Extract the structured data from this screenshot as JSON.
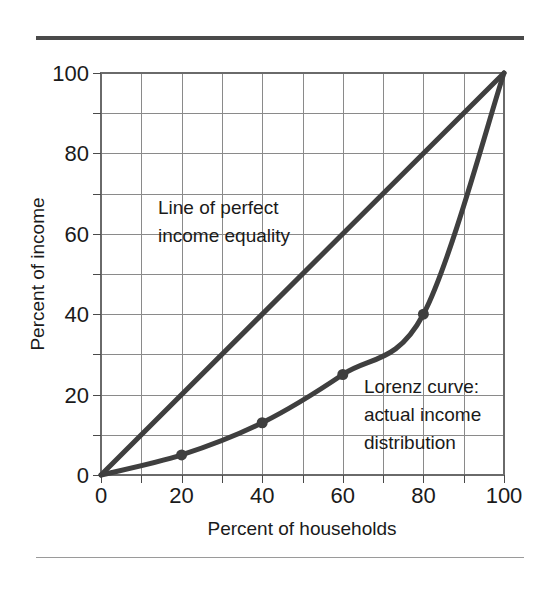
{
  "figure": {
    "rule_top_color": "#4a4a4a",
    "rule_bottom_color": "#9a9a9a",
    "background": "#ffffff"
  },
  "chart_data": {
    "type": "line",
    "title": "",
    "xlabel": "Percent of households",
    "ylabel": "Percent of income",
    "xlim": [
      0,
      100
    ],
    "ylim": [
      0,
      100
    ],
    "xticks": [
      "0",
      "20",
      "40",
      "60",
      "80",
      "100"
    ],
    "yticks": [
      "0",
      "20",
      "40",
      "60",
      "80",
      "100"
    ],
    "xtick_values": [
      0,
      20,
      40,
      60,
      80,
      100
    ],
    "ytick_values": [
      0,
      20,
      40,
      60,
      80,
      100
    ],
    "grid": true,
    "grid_step": 10,
    "grid_color": "#8a8a8a",
    "legend": "none",
    "series": [
      {
        "name": "Line of perfect income equality",
        "x": [
          0,
          100
        ],
        "values": [
          0,
          100
        ],
        "color": "#3f3f3f",
        "markers": false
      },
      {
        "name": "Lorenz curve: actual income distribution",
        "x": [
          0,
          20,
          40,
          60,
          80,
          100
        ],
        "values": [
          0,
          5,
          13,
          25,
          40,
          100
        ],
        "color": "#3f3f3f",
        "markers": true
      }
    ],
    "annotations": [
      {
        "id": "equality-annotation",
        "lines": [
          "Line of perfect",
          "income equality"
        ],
        "x": 15,
        "y": 68
      },
      {
        "id": "lorenz-annotation",
        "lines": [
          "Lorenz curve:",
          "actual income",
          "distribution"
        ],
        "x": 62,
        "y": 24
      }
    ]
  },
  "labels": {
    "x_axis_title": "Percent of households",
    "y_axis_title": "Percent of income",
    "xtick_0": "0",
    "xtick_1": "20",
    "xtick_2": "40",
    "xtick_3": "60",
    "xtick_4": "80",
    "xtick_5": "100",
    "ytick_0": "0",
    "ytick_1": "20",
    "ytick_2": "40",
    "ytick_3": "60",
    "ytick_4": "80",
    "ytick_5": "100",
    "annot_equality_line1": "Line of perfect",
    "annot_equality_line2": "income equality",
    "annot_lorenz_line1": "Lorenz curve:",
    "annot_lorenz_line2": "actual income",
    "annot_lorenz_line3": "distribution"
  }
}
